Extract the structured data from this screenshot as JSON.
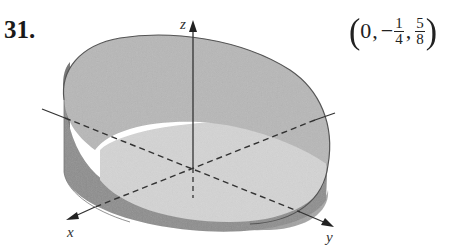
{
  "problem": {
    "number": "31.",
    "answer": {
      "open": "(",
      "x": "0",
      "comma1": ",",
      "y_sign": "−",
      "y_num": "1",
      "y_den": "4",
      "comma2": ",",
      "z_num": "5",
      "z_den": "8",
      "close": ")"
    }
  },
  "figure": {
    "axes": {
      "x_label": "x",
      "y_label": "y",
      "z_label": "z"
    },
    "colors": {
      "top_surface": "#b9b9b9",
      "side_wall_dark": "#7d7d7d",
      "side_wall_mid": "#a3a3a3",
      "base_disk": "#dcdcdc",
      "outline": "#555555",
      "axis": "#333333"
    }
  }
}
